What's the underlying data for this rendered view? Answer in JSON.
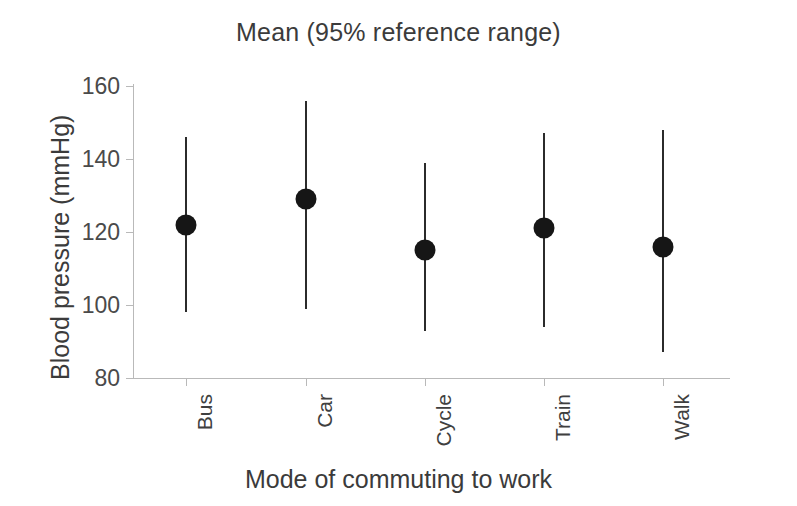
{
  "chart_data": {
    "type": "scatter",
    "title": "Mean (95% reference range)",
    "xlabel": "Mode of commuting to work",
    "ylabel": "Blood pressure (mmHg)",
    "categories": [
      "Bus",
      "Car",
      "Cycle",
      "Train",
      "Walk"
    ],
    "ylim": [
      80,
      160
    ],
    "yticks": [
      80,
      100,
      120,
      140,
      160
    ],
    "grid": false,
    "legend": null,
    "series": [
      {
        "name": "Mean blood pressure",
        "values": [
          122,
          129,
          115,
          121,
          116
        ],
        "error_low": [
          98,
          99,
          93,
          94,
          87
        ],
        "error_high": [
          146,
          156,
          139,
          147,
          148
        ]
      }
    ],
    "points": [
      {
        "category": "Bus",
        "mean": 122,
        "lower": 98,
        "upper": 146
      },
      {
        "category": "Car",
        "mean": 129,
        "lower": 99,
        "upper": 156
      },
      {
        "category": "Cycle",
        "mean": 115,
        "lower": 93,
        "upper": 139
      },
      {
        "category": "Train",
        "mean": 121,
        "lower": 94,
        "upper": 147
      },
      {
        "category": "Walk",
        "mean": 116,
        "lower": 87,
        "upper": 148
      }
    ],
    "marker": "filled-circle",
    "marker_color": "#161616",
    "line_color": "#2b2b2b",
    "axis_color": "#b9b9b9",
    "background": "#ffffff"
  }
}
